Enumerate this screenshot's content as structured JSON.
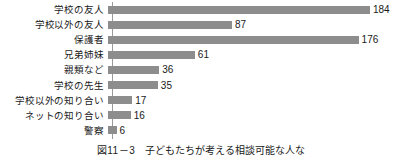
{
  "chart_data": {
    "type": "bar",
    "orientation": "horizontal",
    "title": "",
    "xlabel": "",
    "ylabel": "",
    "grid": false,
    "legend": null,
    "axis_line": true,
    "xlim": [
      0,
      184
    ],
    "bar_color": "#8d8d8d",
    "text_color": "#1a1a1a",
    "value_labels": true,
    "categories": [
      "学校の友人",
      "学校以外の友人",
      "保護者",
      "兄弟姉妹",
      "親類など",
      "学校の先生",
      "学校以外の知り合い",
      "ネットの知り合い",
      "警察"
    ],
    "values": [
      184,
      87,
      176,
      61,
      36,
      35,
      17,
      16,
      6
    ]
  },
  "caption": {
    "number": "図11－3",
    "text": "子どもたちが考える相談可能な人な"
  }
}
